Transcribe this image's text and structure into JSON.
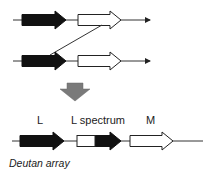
{
  "diagram": {
    "type": "gene-array-recombination",
    "colors": {
      "gene_L": "#111111",
      "gene_M": "#ffffff",
      "outline": "#222222",
      "process_arrow": "#7a7a7a"
    },
    "top_arrays": [
      {
        "genes": [
          "L",
          "M"
        ]
      },
      {
        "genes": [
          "L",
          "M"
        ]
      }
    ],
    "crossover": "unequal crossover between M gene of upper array and L gene of lower array",
    "result": {
      "labels": {
        "gene1": "L",
        "gene2": "L spectrum",
        "gene3": "M"
      },
      "caption": "Deutan array"
    }
  }
}
